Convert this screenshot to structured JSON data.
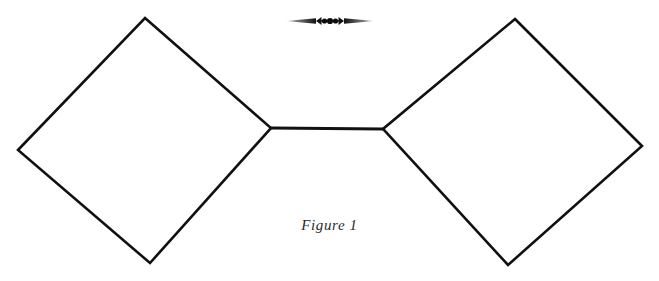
{
  "page": {
    "background_color": "#ffffff",
    "ink_color": "#111111",
    "width": 659,
    "height": 281
  },
  "ornament": {
    "name": "fleuron-divider",
    "description": "horizontal typographic fleuron with tapered spear ends and three central dots",
    "center_x": 330,
    "center_y": 21,
    "half_width": 46,
    "color": "#1a1a1a"
  },
  "caption": {
    "text": "Figure 1",
    "style": "italic",
    "color": "#2b2b2b"
  },
  "diagram": {
    "type": "line-drawing",
    "stroke_color": "#111111",
    "stroke_width": 2.6,
    "shapes": [
      {
        "name": "left-diamond",
        "type": "polygon",
        "points": "145,18 271,128 150,263 18,150"
      },
      {
        "name": "right-diamond",
        "type": "polygon",
        "points": "515,19 642,146 508,265 383,129"
      }
    ],
    "connector": {
      "name": "connector-segment",
      "type": "line",
      "x1": 271,
      "y1": 128,
      "x2": 383,
      "y2": 129
    }
  }
}
